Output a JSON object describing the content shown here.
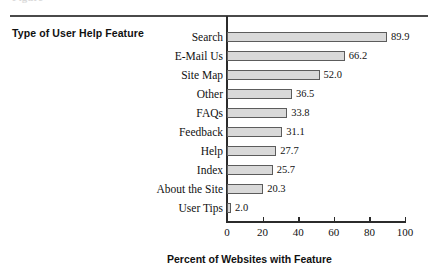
{
  "figure": {
    "top_cropped_caption": "Figure",
    "y_axis_title": "Type of User Help Feature",
    "x_axis_title": "Percent of Websites with Feature",
    "bar_fill_color": "#d9d9d9",
    "bar_border_color": "#5c5c5c",
    "axis_color": "#2b2b2b",
    "background_color": "#ffffff"
  },
  "chart_data": {
    "type": "bar",
    "orientation": "horizontal",
    "title": "",
    "xlabel": "Percent of Websites with Feature",
    "ylabel": "Type of User Help Feature",
    "xlim": [
      0,
      100
    ],
    "xticks": [
      0,
      20,
      40,
      60,
      80,
      100
    ],
    "grid": false,
    "legend": false,
    "categories": [
      "Search",
      "E-Mail Us",
      "Site Map",
      "Other",
      "FAQs",
      "Feedback",
      "Help",
      "Index",
      "About the Site",
      "User Tips"
    ],
    "values": [
      89.9,
      66.2,
      52.0,
      36.5,
      33.8,
      31.1,
      27.7,
      25.7,
      20.3,
      2.0
    ],
    "data_labels": [
      "89.9",
      "66.2",
      "52.0",
      "36.5",
      "33.8",
      "31.1",
      "27.7",
      "25.7",
      "20.3",
      "2.0"
    ],
    "xtick_labels": [
      "0",
      "20",
      "40",
      "60",
      "80",
      "100"
    ]
  }
}
